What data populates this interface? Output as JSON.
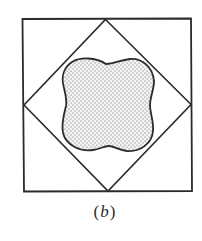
{
  "figure": {
    "caption": {
      "open": "(",
      "letter": "b",
      "close": ")"
    },
    "colors": {
      "stroke": "#2b2b2b",
      "fill_background": "#f2f2f2",
      "stipple": "#5a5a5a",
      "page": "#ffffff"
    },
    "shapes": {
      "outer_square": {
        "label": "outer square"
      },
      "inscribed_diamond": {
        "label": "diamond inscribed in square, vertices at side midpoints"
      },
      "stippled_region": {
        "label": "stippled four-lobed region inside diamond",
        "pattern": "dotted stipple"
      }
    }
  }
}
